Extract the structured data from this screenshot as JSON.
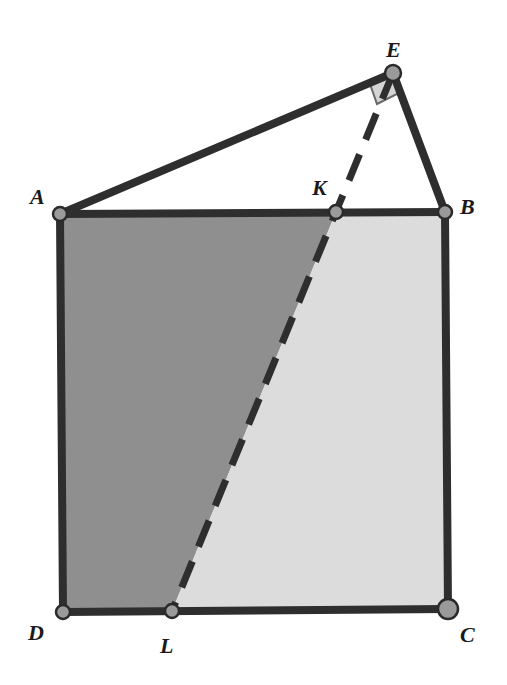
{
  "diagram": {
    "type": "geometry",
    "colors": {
      "background": "#ffffff",
      "dark_region": "#8f8f8f",
      "light_region": "#dcdcdc",
      "stroke": "#2e2e2e",
      "point_fill": "#9a9a9a",
      "right_angle_marker": "#d4d4d4"
    },
    "points": {
      "A": {
        "label": "A",
        "x": 60,
        "y": 214
      },
      "B": {
        "label": "B",
        "x": 445,
        "y": 212
      },
      "C": {
        "label": "C",
        "x": 448,
        "y": 609
      },
      "D": {
        "label": "D",
        "x": 63,
        "y": 612
      },
      "E": {
        "label": "E",
        "x": 393,
        "y": 73
      },
      "K": {
        "label": "K",
        "x": 336,
        "y": 212
      },
      "L": {
        "label": "L",
        "x": 172,
        "y": 611
      }
    },
    "segments": [
      "AB",
      "BC",
      "CD",
      "DA",
      "AE",
      "EB"
    ],
    "dashed_segments": [
      "EL"
    ],
    "regions": [
      {
        "name": "AKLD",
        "shade": "dark"
      },
      {
        "name": "KBCL",
        "shade": "light"
      }
    ],
    "right_angle_at": "E"
  }
}
